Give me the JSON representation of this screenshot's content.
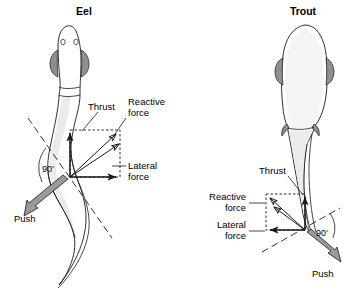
{
  "figure": {
    "background_color": "#ffffff",
    "line_color": "#1a1a1a",
    "body_fill_color": "#f2f2f2",
    "push_arrow_color": "#9a9a9a"
  },
  "panels": [
    {
      "id": "eel",
      "title": "Eel",
      "title_position": {
        "x": 84,
        "y": 15
      },
      "body_style": "elongate-anguilliform",
      "origin": {
        "x": 70,
        "y": 177
      },
      "angle_label": "90",
      "angle_degree_symbol": "°",
      "labels": {
        "thrust": "Thrust",
        "reactive_force_line1": "Reactive",
        "reactive_force_line2": "force",
        "lateral_force_line1": "Lateral",
        "lateral_force_line2": "force",
        "push": "Push"
      },
      "label_positions": {
        "thrust": {
          "x": 90,
          "y": 108
        },
        "reactive_force": {
          "x": 128,
          "y": 108
        },
        "lateral_force": {
          "x": 128,
          "y": 170
        },
        "push": {
          "x": 16,
          "y": 216
        },
        "angle": {
          "x": 45,
          "y": 170
        }
      },
      "vectors": [
        {
          "name": "thrust",
          "direction": "up",
          "dx": 0,
          "dy": -47,
          "style": "solid-thick"
        },
        {
          "name": "lateral-force",
          "direction": "right",
          "dx": 50,
          "dy": 0,
          "style": "solid-thick"
        },
        {
          "name": "reactive-force",
          "direction": "up-right-diagonal",
          "dx": 50,
          "dy": -47,
          "style": "solid-thin"
        },
        {
          "name": "reactive-force-component",
          "direction": "up-right-shallow",
          "dx": 48,
          "dy": -36,
          "style": "solid-thin"
        },
        {
          "name": "push",
          "direction": "down-left",
          "dx": -48,
          "dy": 36,
          "style": "filled-gray"
        }
      ],
      "components_box": {
        "x": 70,
        "y": 130,
        "width": 50,
        "height": 47
      }
    },
    {
      "id": "trout",
      "title": "Trout",
      "title_position": {
        "x": 288,
        "y": 15
      },
      "body_style": "fusiform-carangiform",
      "origin": {
        "x": 305,
        "y": 230
      },
      "angle_label": "90",
      "angle_degree_symbol": "°",
      "labels": {
        "thrust": "Thrust",
        "reactive_force_line1": "Reactive",
        "reactive_force_line2": "force",
        "lateral_force_line1": "Lateral",
        "lateral_force_line2": "force",
        "push": "Push"
      },
      "label_positions": {
        "thrust": {
          "x": 251,
          "y": 172
        },
        "reactive_force": {
          "x": 242,
          "y": 210
        },
        "lateral_force": {
          "x": 242,
          "y": 238
        },
        "push": {
          "x": 318,
          "y": 272
        },
        "angle": {
          "x": 318,
          "y": 234
        }
      },
      "vectors": [
        {
          "name": "thrust",
          "direction": "up",
          "dx": 0,
          "dy": -36,
          "style": "solid-thick"
        },
        {
          "name": "lateral-force",
          "direction": "left",
          "dx": -39,
          "dy": 0,
          "style": "solid-thick"
        },
        {
          "name": "reactive-force",
          "direction": "up-left-diagonal",
          "dx": -39,
          "dy": -36,
          "style": "solid-thin"
        },
        {
          "name": "reactive-force-component",
          "direction": "up-left-shallow",
          "dx": -36,
          "dy": -28,
          "style": "solid-thin"
        },
        {
          "name": "push",
          "direction": "down-right",
          "dx": 36,
          "dy": 28,
          "style": "filled-gray"
        }
      ],
      "components_box": {
        "x": 266,
        "y": 194,
        "width": 39,
        "height": 36
      }
    }
  ]
}
